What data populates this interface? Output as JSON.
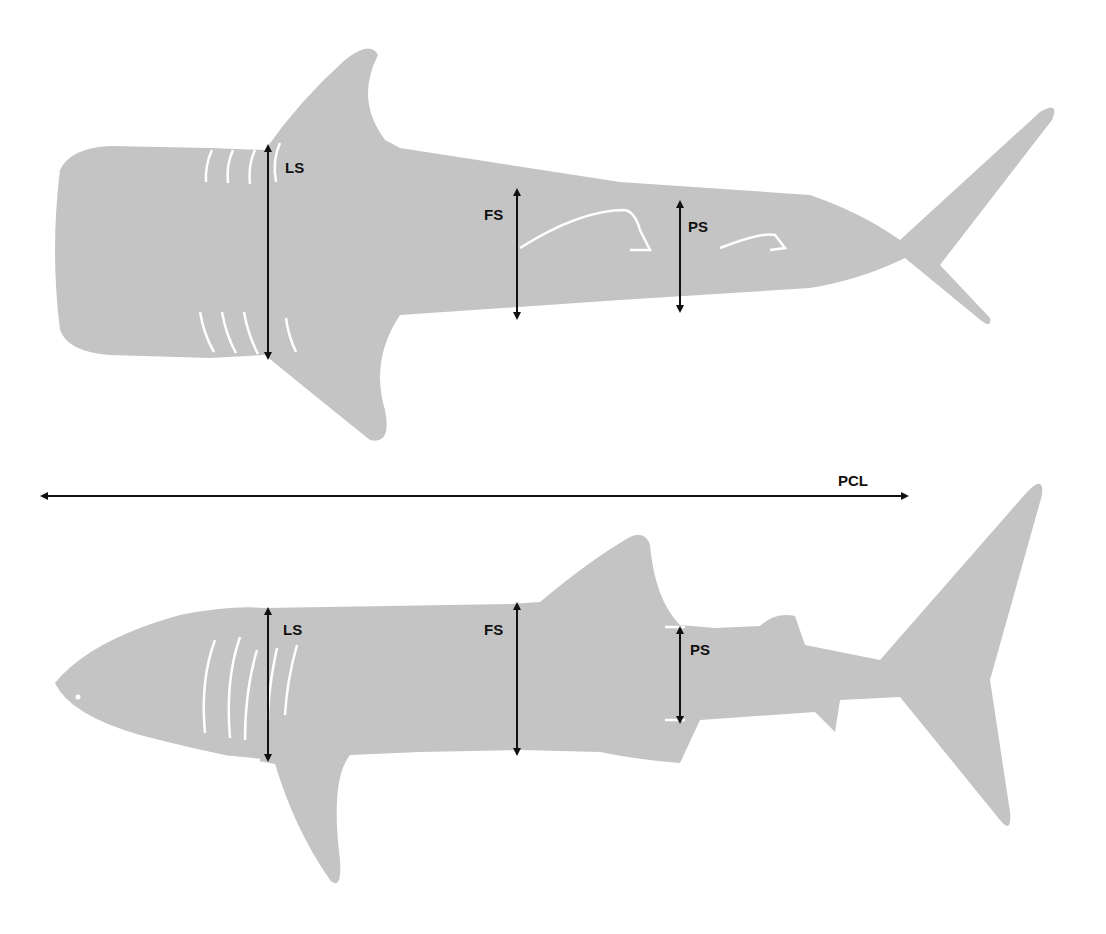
{
  "colors": {
    "body": "#c4c4c4",
    "marks": "#ffffff",
    "arrow": "#111111",
    "background": "#ffffff"
  },
  "top_view": {
    "name": "dorsal view",
    "labels": {
      "ls": "LS",
      "fs": "FS",
      "ps": "PS"
    }
  },
  "pcl": {
    "label": "PCL"
  },
  "side_view": {
    "name": "lateral view",
    "labels": {
      "ls": "LS",
      "fs": "FS",
      "ps": "PS"
    }
  }
}
